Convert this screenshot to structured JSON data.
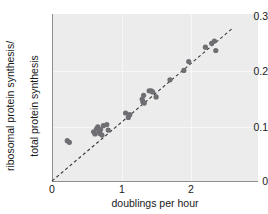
{
  "chart_data": {
    "type": "scatter",
    "title": "",
    "xlabel": "doublings per hour",
    "ylabel_line1": "ribosomal protein synthesis/",
    "ylabel_line2": "total protein synthesis",
    "xlim": [
      0,
      2.95
    ],
    "ylim": [
      0,
      0.305
    ],
    "xticks": [
      0,
      1,
      2
    ],
    "xticklabels": [
      "0",
      "1",
      "2"
    ],
    "yticks": [
      0,
      0.1,
      0.2,
      0.3
    ],
    "yticklabels": [
      "0",
      "0.1",
      "0.2",
      "0.3"
    ],
    "grid": true,
    "legend": "none",
    "point_color": "#6e6e73",
    "panel_color": "#ececec",
    "trendline": {
      "style": "dashed",
      "color": "#3a3a3a",
      "x": [
        0.0,
        2.6
      ],
      "y": [
        0.0,
        0.276
      ],
      "slope": 0.1062,
      "intercept": 0.0
    },
    "points": [
      {
        "x": 0.22,
        "y": 0.073
      },
      {
        "x": 0.25,
        "y": 0.07
      },
      {
        "x": 0.6,
        "y": 0.089
      },
      {
        "x": 0.62,
        "y": 0.085
      },
      {
        "x": 0.64,
        "y": 0.094
      },
      {
        "x": 0.66,
        "y": 0.098
      },
      {
        "x": 0.68,
        "y": 0.09
      },
      {
        "x": 0.69,
        "y": 0.086
      },
      {
        "x": 0.7,
        "y": 0.093
      },
      {
        "x": 0.72,
        "y": 0.083
      },
      {
        "x": 0.74,
        "y": 0.1
      },
      {
        "x": 0.79,
        "y": 0.102
      },
      {
        "x": 0.81,
        "y": 0.092
      },
      {
        "x": 1.06,
        "y": 0.123
      },
      {
        "x": 1.1,
        "y": 0.115
      },
      {
        "x": 1.12,
        "y": 0.12
      },
      {
        "x": 1.3,
        "y": 0.148
      },
      {
        "x": 1.31,
        "y": 0.143
      },
      {
        "x": 1.32,
        "y": 0.155
      },
      {
        "x": 1.33,
        "y": 0.141
      },
      {
        "x": 1.4,
        "y": 0.163
      },
      {
        "x": 1.43,
        "y": 0.163
      },
      {
        "x": 1.45,
        "y": 0.161
      },
      {
        "x": 1.5,
        "y": 0.152
      },
      {
        "x": 1.7,
        "y": 0.183
      },
      {
        "x": 1.9,
        "y": 0.2
      },
      {
        "x": 1.97,
        "y": 0.216
      },
      {
        "x": 2.21,
        "y": 0.242
      },
      {
        "x": 2.3,
        "y": 0.249
      },
      {
        "x": 2.34,
        "y": 0.253
      },
      {
        "x": 2.36,
        "y": 0.236
      }
    ]
  }
}
